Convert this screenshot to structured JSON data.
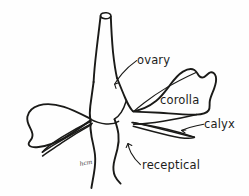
{
  "figure": {
    "kind": "botanical-line-drawing",
    "background_color": "#fefefe",
    "ink_color": "#1a1a18",
    "text_color": "#1d1d1b"
  },
  "labels": {
    "ovary": "ovary",
    "corolla": "corolla",
    "calyx": "calyx",
    "receptical": "receptical"
  },
  "annotation": {
    "handwritten_note": "hcm"
  },
  "parts": {
    "style_tube": "style-tube",
    "ovary_body": "ovary-body",
    "left_petal": "left-petal",
    "right_petal": "right-petal",
    "left_sepals": "left-sepals",
    "right_sepals": "right-sepals",
    "receptacle": "receptacle",
    "pedicel": "pedicel"
  }
}
